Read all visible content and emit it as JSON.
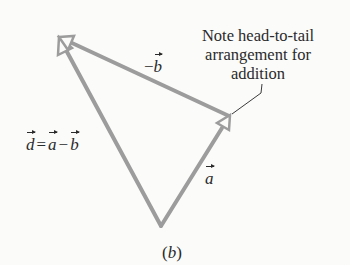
{
  "figure": {
    "panel_label": "(b)",
    "panel_letter": "b",
    "note": {
      "line1": "Note head-to-tail",
      "line2": "arrangement for",
      "line3": "addition"
    },
    "labels": {
      "neg_b": {
        "sign": "−",
        "symbol": "b"
      },
      "a": {
        "symbol": "a"
      },
      "d_equation": {
        "d": "d",
        "eq": "=",
        "a": "a",
        "minus": "−",
        "b": "b"
      }
    },
    "vectors": [
      {
        "name": "a",
        "from": [
          161,
          226
        ],
        "to": [
          229,
          116
        ]
      },
      {
        "name": "-b",
        "from": [
          229,
          116
        ],
        "to": [
          59,
          37
        ]
      },
      {
        "name": "d",
        "from": [
          161,
          226
        ],
        "to": [
          59,
          37
        ]
      }
    ],
    "colors": {
      "arrow": "#9c9c9c",
      "text": "#2a2a2a",
      "background": "#fbfbfa"
    }
  }
}
